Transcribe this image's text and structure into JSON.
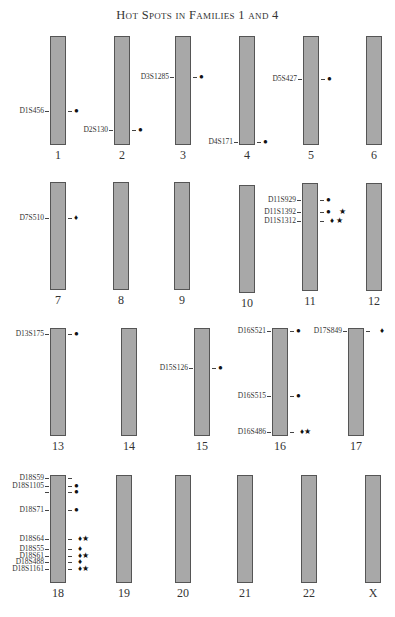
{
  "title": "Hot Spots in Families 1 and 4",
  "legend_symbols": {
    "circle": "●",
    "diamond": "♦",
    "star": "★"
  },
  "chromosomes": [
    {
      "id": "1",
      "label": "1",
      "x": 50,
      "top": 36,
      "bottom": 145
    },
    {
      "id": "2",
      "label": "2",
      "x": 114,
      "top": 36,
      "bottom": 145
    },
    {
      "id": "3",
      "label": "3",
      "x": 175,
      "top": 36,
      "bottom": 145
    },
    {
      "id": "4",
      "label": "4",
      "x": 239,
      "top": 36,
      "bottom": 145
    },
    {
      "id": "5",
      "label": "5",
      "x": 303,
      "top": 36,
      "bottom": 145
    },
    {
      "id": "6",
      "label": "6",
      "x": 366,
      "top": 36,
      "bottom": 145
    },
    {
      "id": "7",
      "label": "7",
      "x": 50,
      "top": 182,
      "bottom": 290
    },
    {
      "id": "8",
      "label": "8",
      "x": 113,
      "top": 182,
      "bottom": 290
    },
    {
      "id": "9",
      "label": "9",
      "x": 174,
      "top": 182,
      "bottom": 290
    },
    {
      "id": "10",
      "label": "10",
      "x": 239,
      "top": 185,
      "bottom": 293
    },
    {
      "id": "11",
      "label": "11",
      "x": 302,
      "top": 183,
      "bottom": 291
    },
    {
      "id": "12",
      "label": "12",
      "x": 366,
      "top": 183,
      "bottom": 291
    },
    {
      "id": "13",
      "label": "13",
      "x": 50,
      "top": 328,
      "bottom": 436
    },
    {
      "id": "14",
      "label": "14",
      "x": 121,
      "top": 328,
      "bottom": 436
    },
    {
      "id": "15",
      "label": "15",
      "x": 194,
      "top": 328,
      "bottom": 436
    },
    {
      "id": "16",
      "label": "16",
      "x": 272,
      "top": 328,
      "bottom": 436
    },
    {
      "id": "17",
      "label": "17",
      "x": 348,
      "top": 328,
      "bottom": 436
    },
    {
      "id": "18",
      "label": "18",
      "x": 50,
      "top": 475,
      "bottom": 583
    },
    {
      "id": "19",
      "label": "19",
      "x": 116,
      "top": 475,
      "bottom": 583
    },
    {
      "id": "20",
      "label": "20",
      "x": 175,
      "top": 475,
      "bottom": 583
    },
    {
      "id": "21",
      "label": "21",
      "x": 237,
      "top": 475,
      "bottom": 583
    },
    {
      "id": "22",
      "label": "22",
      "x": 301,
      "top": 475,
      "bottom": 583
    },
    {
      "id": "X",
      "label": "X",
      "x": 365,
      "top": 475,
      "bottom": 583
    }
  ],
  "markers": [
    {
      "chromosome": "1",
      "name": "D1S456",
      "y": 111,
      "symbols": "●"
    },
    {
      "chromosome": "2",
      "name": "D2S130",
      "y": 130,
      "symbols": "●"
    },
    {
      "chromosome": "3",
      "name": "D3S1285",
      "y": 77,
      "symbols": "●"
    },
    {
      "chromosome": "4",
      "name": "D4S171",
      "y": 142,
      "symbols": "●"
    },
    {
      "chromosome": "5",
      "name": "D5S427",
      "y": 79,
      "symbols": "●"
    },
    {
      "chromosome": "7",
      "name": "D7S510",
      "y": 218,
      "symbols": "♦"
    },
    {
      "chromosome": "11",
      "name": "D11S929",
      "y": 200,
      "symbols": "●"
    },
    {
      "chromosome": "11",
      "name": "D11S1392",
      "y": 212,
      "symbols": "●    ★"
    },
    {
      "chromosome": "11",
      "name": "D11S1312",
      "y": 221,
      "symbols": "  ♦ ★"
    },
    {
      "chromosome": "13",
      "name": "D13S175",
      "y": 334,
      "symbols": "●"
    },
    {
      "chromosome": "15",
      "name": "D15S126",
      "y": 368,
      "symbols": "●"
    },
    {
      "chromosome": "16",
      "name": "D16S521",
      "y": 331,
      "symbols": "●"
    },
    {
      "chromosome": "16",
      "name": "D16S515",
      "y": 396,
      "symbols": "●"
    },
    {
      "chromosome": "16",
      "name": "D16S486",
      "y": 432,
      "symbols": "  ♦★"
    },
    {
      "chromosome": "17",
      "name": "D17S849",
      "y": 331,
      "symbols": "    ♦"
    },
    {
      "chromosome": "18",
      "name": "D18S59",
      "y": 478,
      "symbols": ""
    },
    {
      "chromosome": "18",
      "name": "D18S1105",
      "y": 486,
      "symbols": "●"
    },
    {
      "chromosome": "18",
      "name": "",
      "y": 492,
      "symbols": "●"
    },
    {
      "chromosome": "18",
      "name": "D18S71",
      "y": 510,
      "symbols": "●"
    },
    {
      "chromosome": "18",
      "name": "D18S64",
      "y": 539,
      "symbols": "  ♦★"
    },
    {
      "chromosome": "18",
      "name": "D18S55",
      "y": 549,
      "symbols": "  ♦"
    },
    {
      "chromosome": "18",
      "name": "D18S61",
      "y": 556,
      "symbols": "  ♦★"
    },
    {
      "chromosome": "18",
      "name": "D18S488",
      "y": 562,
      "symbols": "  ♦"
    },
    {
      "chromosome": "18",
      "name": "D18S1161",
      "y": 569,
      "symbols": "  ♦★"
    }
  ]
}
